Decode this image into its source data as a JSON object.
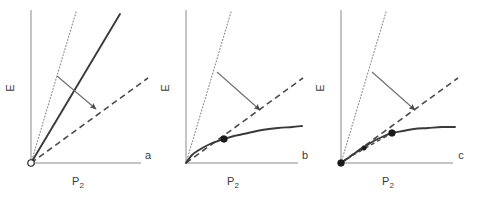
{
  "figure": {
    "width": 485,
    "height": 200,
    "background": "#ffffff",
    "panel_count": 3
  },
  "style": {
    "axis_color": "#8a8a8a",
    "dotted_color": "#8a8a8a",
    "solid_color": "#3a3a3a",
    "dashed_color": "#4a4a4a",
    "arrow_color": "#6e6e6e",
    "marker_color": "#1a1a1a",
    "text_color": "#3a3a3a"
  },
  "axis_labels": {
    "y": "E",
    "x_main": "P",
    "x_subscript": "2"
  },
  "panels": [
    {
      "id": "a",
      "label": "a",
      "label_pos": {
        "x": 148,
        "y": 159
      },
      "origin": {
        "x": 31,
        "y": 163
      },
      "y_axis": {
        "x": 31,
        "y_top": 10,
        "y_bottom": 163
      },
      "x_axis": {
        "y": 163,
        "x_left": 31,
        "x_right": 141
      },
      "y_label_pos": {
        "x": 14,
        "y": 88
      },
      "x_label_pos": {
        "x": 78,
        "y": 185
      },
      "curves": [
        {
          "name": "dotted-reference-line",
          "style": "dotted",
          "points": [
            [
              31,
              163
            ],
            [
              76,
              12
            ]
          ]
        },
        {
          "name": "solid-response-line",
          "style": "solid",
          "points": [
            [
              31,
              163
            ],
            [
              120,
              14
            ]
          ]
        },
        {
          "name": "dashed-asymptote-line",
          "style": "dashed",
          "points": [
            [
              31,
              163
            ],
            [
              148,
              78
            ]
          ]
        }
      ],
      "arrow": {
        "x1": 57,
        "y1": 76,
        "x2": 96,
        "y2": 109
      },
      "markers": [
        {
          "name": "origin-open-marker",
          "x": 31,
          "y": 163,
          "r": 3.2,
          "filled": false
        }
      ]
    },
    {
      "id": "b",
      "label": "b",
      "label_pos": {
        "x": 305,
        "y": 159
      },
      "origin": {
        "x": 186,
        "y": 163
      },
      "y_axis": {
        "x": 186,
        "y_top": 10,
        "y_bottom": 163
      },
      "x_axis": {
        "y": 163,
        "x_left": 186,
        "x_right": 298
      },
      "y_label_pos": {
        "x": 169,
        "y": 88
      },
      "x_label_pos": {
        "x": 233,
        "y": 185
      },
      "curves": [
        {
          "name": "dotted-reference-line",
          "style": "dotted",
          "points": [
            [
              186,
              163
            ],
            [
              231,
              12
            ]
          ]
        },
        {
          "name": "dashed-asymptote-line",
          "style": "dashed",
          "points": [
            [
              186,
              163
            ],
            [
              303,
              78
            ]
          ]
        },
        {
          "name": "solid-saturating-curve",
          "style": "solid-curve",
          "points": [
            [
              186,
              163
            ],
            [
              192,
              155
            ],
            [
              199,
              150
            ],
            [
              208,
              145
            ],
            [
              218,
              141
            ],
            [
              224,
              139
            ],
            [
              234,
              136
            ],
            [
              248,
              133
            ],
            [
              262,
              130
            ],
            [
              278,
              128
            ],
            [
              292,
              127
            ],
            [
              302,
              126
            ]
          ]
        }
      ],
      "arrow": {
        "x1": 217,
        "y1": 72,
        "x2": 260,
        "y2": 110
      },
      "markers": [
        {
          "name": "tangency-marker",
          "x": 224,
          "y": 139,
          "r": 3.3,
          "filled": true
        }
      ]
    },
    {
      "id": "c",
      "label": "c",
      "label_pos": {
        "x": 461,
        "y": 159
      },
      "origin": {
        "x": 341,
        "y": 163
      },
      "y_axis": {
        "x": 341,
        "y_top": 10,
        "y_bottom": 163
      },
      "x_axis": {
        "y": 163,
        "x_left": 341,
        "x_right": 453
      },
      "y_label_pos": {
        "x": 324,
        "y": 88
      },
      "x_label_pos": {
        "x": 388,
        "y": 185
      },
      "curves": [
        {
          "name": "dotted-reference-line",
          "style": "dotted",
          "points": [
            [
              341,
              163
            ],
            [
              386,
              12
            ]
          ]
        },
        {
          "name": "dashed-asymptote-line",
          "style": "dashed",
          "points": [
            [
              341,
              163
            ],
            [
              458,
              78
            ]
          ]
        },
        {
          "name": "solid-sigmoid-curve",
          "style": "solid-curve",
          "points": [
            [
              341,
              163
            ],
            [
              348,
              158
            ],
            [
              355,
              153
            ],
            [
              363,
              148
            ],
            [
              372,
              142
            ],
            [
              382,
              137
            ],
            [
              392,
              133
            ],
            [
              403,
              131
            ],
            [
              414,
              129
            ],
            [
              428,
              128
            ],
            [
              442,
              127
            ],
            [
              455,
              127
            ]
          ]
        },
        {
          "name": "dashed-inner-chord",
          "style": "dashed-short",
          "points": [
            [
              341,
              163
            ],
            [
              352,
              156
            ],
            [
              364,
              149
            ],
            [
              376,
              142
            ],
            [
              387,
              136
            ],
            [
              392,
              133
            ]
          ]
        }
      ],
      "arrow": {
        "x1": 372,
        "y1": 72,
        "x2": 415,
        "y2": 110
      },
      "markers": [
        {
          "name": "origin-filled-marker",
          "x": 341,
          "y": 163,
          "r": 3.3,
          "filled": true
        },
        {
          "name": "inflection-marker",
          "x": 364,
          "y": 148,
          "r": 2.2,
          "filled": true
        },
        {
          "name": "tangency-marker",
          "x": 392,
          "y": 133,
          "r": 3.3,
          "filled": true
        }
      ]
    }
  ]
}
